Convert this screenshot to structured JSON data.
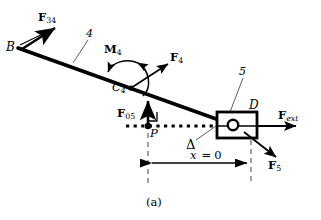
{
  "figure": {
    "caption": "(a)",
    "cut_off_header": "",
    "background_color": "#ffffff",
    "stroke_color": "#000000"
  },
  "labels": {
    "force_34": {
      "base": "F",
      "sub": "34"
    },
    "point_b": "B",
    "link_4": "4",
    "moment_4": {
      "base": "M",
      "sub": "4"
    },
    "force_4": {
      "base": "F",
      "sub": "4"
    },
    "point_c4": {
      "base": "C",
      "sub": "4"
    },
    "force_05": {
      "base": "F",
      "sub": "05"
    },
    "point_p": "P",
    "delta": "Δ",
    "link_5": "5",
    "point_d": "D",
    "force_ext": {
      "base": "F",
      "sub": "ext"
    },
    "force_5": {
      "base": "F",
      "sub": "5"
    },
    "dimension": {
      "var": "x",
      "eq": "=",
      "value": "0"
    }
  },
  "geometry": {
    "link4": {
      "x1": 18,
      "y1": 48,
      "x2": 232,
      "y2": 125
    },
    "point_b": {
      "x": 18,
      "y": 48
    },
    "point_c4": {
      "x": 131,
      "y": 88
    },
    "point_p": {
      "x": 148,
      "y": 126
    },
    "point_d": {
      "x": 233,
      "y": 125
    },
    "slider_block": {
      "x": 217,
      "y": 112,
      "w": 40,
      "h": 26
    },
    "slideline_y": 126,
    "slideline_x1": 126,
    "slideline_x2": 232,
    "dimension_line": {
      "y": 163,
      "x1": 148,
      "x2": 250
    }
  },
  "arrows": {
    "F34": {
      "x1": 22,
      "y1": 47,
      "x2": 57,
      "y2": 26
    },
    "F4": {
      "x1": 131,
      "y1": 88,
      "x2": 172,
      "y2": 62
    },
    "F05": {
      "x1": 148,
      "y1": 126,
      "x2": 148,
      "y2": 100
    },
    "Fext": {
      "x1": 257,
      "y1": 126,
      "x2": 297,
      "y2": 126
    },
    "F5": {
      "x1": 245,
      "y1": 131,
      "x2": 278,
      "y2": 158
    }
  }
}
